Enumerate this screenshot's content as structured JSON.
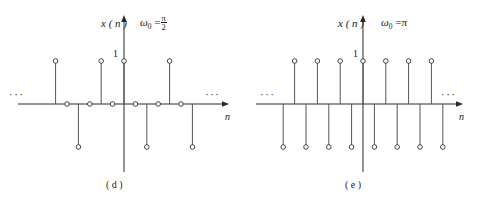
{
  "figure": {
    "title": "",
    "panels": [
      {
        "id": "panel-d",
        "caption": "( d )",
        "y_axis_label": "x ( n )",
        "omega_label": "ω",
        "omega_sub": "0",
        "omega_eq": "=",
        "omega_value_num": "π",
        "omega_value_den": "2",
        "omega_value_plain": "π/2",
        "x_axis_label": "n",
        "amplitude_label": "1",
        "left_ellipsis": "···",
        "right_ellipsis": "···",
        "chart_data": {
          "type": "scatter",
          "title": "",
          "subtitle": "ω₀ = π/2",
          "xlabel": "n",
          "ylabel": "x ( n )",
          "ylim": [
            -1,
            1
          ],
          "grid": false,
          "legend": "none",
          "expression": "cos(πn/2)",
          "period": 4,
          "x": [
            -14,
            -13,
            -12,
            -11,
            -10,
            -9,
            -8,
            -7,
            -6,
            -5,
            -4,
            -3,
            -2,
            -1,
            0,
            1,
            2,
            3,
            4,
            5,
            6,
            7,
            8,
            9,
            10,
            11,
            12,
            13,
            14
          ],
          "values": [
            1,
            0,
            -1,
            0,
            1,
            0,
            -1,
            0,
            1,
            0,
            -1,
            0,
            1,
            0,
            1,
            0,
            -1,
            0,
            1,
            0,
            -1,
            0,
            1,
            0,
            -1,
            0,
            1,
            0,
            -1
          ]
        }
      },
      {
        "id": "panel-e",
        "caption": "( e )",
        "y_axis_label": "x ( n )",
        "omega_label": "ω",
        "omega_sub": "0",
        "omega_eq": "=",
        "omega_value_plain": "π",
        "x_axis_label": "n",
        "amplitude_label": "1",
        "left_ellipsis": "···",
        "right_ellipsis": "···",
        "chart_data": {
          "type": "scatter",
          "title": "",
          "subtitle": "ω₀ = π",
          "xlabel": "n",
          "ylabel": "x ( n )",
          "ylim": [
            -1,
            1
          ],
          "grid": false,
          "legend": "none",
          "expression": "cos(πn)",
          "period": 2,
          "x": [
            -14,
            -13,
            -12,
            -11,
            -10,
            -9,
            -8,
            -7,
            -6,
            -5,
            -4,
            -3,
            -2,
            -1,
            0,
            1,
            2,
            3,
            4,
            5,
            6,
            7,
            8,
            9,
            10,
            11,
            12,
            13
          ],
          "values": [
            1,
            -1,
            1,
            -1,
            1,
            -1,
            1,
            -1,
            1,
            -1,
            1,
            -1,
            1,
            -1,
            1,
            -1,
            1,
            -1,
            1,
            -1,
            1,
            -1,
            1,
            -1,
            1,
            -1,
            1,
            -1
          ]
        }
      }
    ],
    "colors": {
      "axis": "#2a2a2a",
      "stem": "#555555",
      "marker_stroke": "#333333",
      "marker_fill": "#ffffff",
      "background": "#ffffff"
    }
  }
}
